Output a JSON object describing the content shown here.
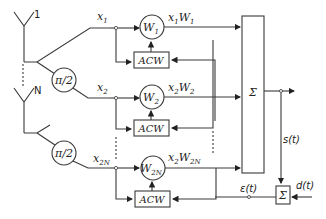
{
  "diagram": {
    "antennas": [
      {
        "label": "1"
      },
      {
        "label": "N"
      }
    ],
    "phase_shifters": [
      {
        "label": "π/2"
      },
      {
        "label": "π/2"
      }
    ],
    "branches": [
      {
        "input": "x",
        "input_sub": "1",
        "weight": "W",
        "weight_sub": "1",
        "output_a": "x",
        "output_a_sub": "1",
        "output_b": "W",
        "output_b_sub": "1",
        "controller": "ACW"
      },
      {
        "input": "x",
        "input_sub": "2",
        "weight": "W",
        "weight_sub": "2",
        "output_a": "x",
        "output_a_sub": "2",
        "output_b": "W",
        "output_b_sub": "2",
        "controller": "ACW"
      },
      {
        "input": "x",
        "input_sub": "2N",
        "weight": "W",
        "weight_sub": "2N",
        "output_a": "x",
        "output_a_sub": "2",
        "output_b": "W",
        "output_b_sub": "2N",
        "controller": "ACW"
      }
    ],
    "summer_label": "Σ",
    "error_summer_label": "Σ",
    "output_signal": "s(t)",
    "desired_signal": "d(t)",
    "error_signal": "ε(t)"
  }
}
